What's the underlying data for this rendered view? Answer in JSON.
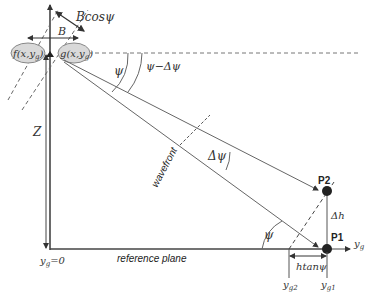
{
  "diagram": {
    "title": "",
    "labels": {
      "bcos": "Bcosψ",
      "b": "B",
      "f_sensor": "f(x,y",
      "f_sub": "g",
      "f_close": ")",
      "g_sensor": "g(x,y",
      "g_sub": "g",
      "g_close": ")",
      "psi_top": "ψ",
      "psi_minus_dpsi": "ψ−Δψ",
      "z": "Z",
      "wavefront": "wavefront",
      "dpsi": "Δψ",
      "p2": "P2",
      "p1": "P1",
      "dh": "Δh",
      "psi_bottom": "ψ",
      "yg_axis": "y",
      "yg_axis_sub": "g",
      "yg_zero": "y",
      "yg_zero_sub": "g",
      "yg_zero_eq": "=0",
      "reference_plane": "reference plane",
      "htan": "htanψ",
      "yg2": "y",
      "yg2_sub": "g2",
      "yg1": "y",
      "yg1_sub": "g1"
    },
    "colors": {
      "line": "#555555",
      "dashed": "#666666",
      "ellipse_fill": "#d9d9d9",
      "ellipse_stroke": "#888888",
      "point": "#222222"
    }
  }
}
